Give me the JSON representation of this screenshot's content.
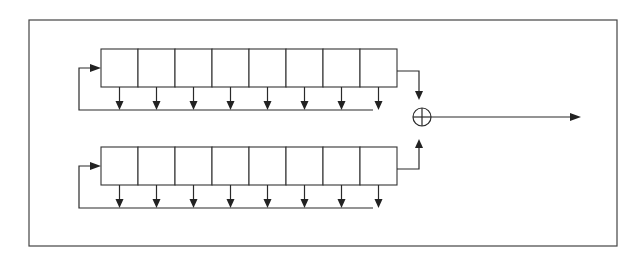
{
  "diagram": {
    "type": "two-LFSR combining generator",
    "colors": {
      "stroke": "#2a2a2a",
      "frame": "#444444",
      "background": "#ffffff"
    },
    "frame": {
      "x": 29,
      "y": 20,
      "width": 588,
      "height": 226
    },
    "registers": [
      {
        "id": "register-1",
        "x": 101,
        "y": 49,
        "cell_width": 37,
        "cell_height": 38,
        "cells": 8,
        "feedback_bus_y": 110,
        "feedback_left_x": 79,
        "feedback_entry_y": 68,
        "bus_end_x": 373,
        "output": {
          "from_y": 71,
          "turn_x": 419,
          "arrow_to_y": 100,
          "direction": "down"
        }
      },
      {
        "id": "register-2",
        "x": 101,
        "y": 147,
        "cell_width": 37,
        "cell_height": 38,
        "cells": 8,
        "feedback_bus_y": 208,
        "feedback_left_x": 79,
        "feedback_entry_y": 166,
        "bus_end_x": 373,
        "output": {
          "from_y": 169,
          "turn_x": 419,
          "arrow_to_y": 139,
          "direction": "up"
        }
      }
    ],
    "combiner": {
      "symbol": "xor",
      "cx": 422,
      "cy": 117,
      "r": 9
    },
    "output_arrow": {
      "x1": 431,
      "y": 117,
      "x2": 581
    }
  }
}
